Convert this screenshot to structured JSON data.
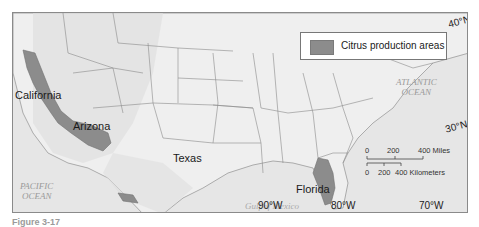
{
  "legend": {
    "swatch_color": "#8c8c8c",
    "label": "Citrus production areas"
  },
  "regions": {
    "california": "California",
    "arizona": "Arizona",
    "texas": "Texas",
    "florida": "Florida"
  },
  "water_bodies": {
    "atlantic_line1": "ATLANTIC",
    "atlantic_line2": "OCEAN",
    "pacific_line1": "PACIFIC",
    "pacific_line2": "OCEAN",
    "gulf": "Gulf of Mexico"
  },
  "coordinates": {
    "lat_40": "40°N",
    "lat_30": "30°N",
    "lon_90": "90°W",
    "lon_80": "80°W",
    "lon_70": "70°W"
  },
  "scale_bar": {
    "miles_0": "0",
    "miles_200": "200",
    "miles_400": "400 Miles",
    "km_0": "0",
    "km_200": "200",
    "km_400": "400 Kilometers"
  },
  "caption": "Figure 3-17",
  "colors": {
    "land": "#ececec",
    "water": "#e4e4e4",
    "citrus": "#8c8c8c",
    "borders": "#7a7a7a"
  }
}
